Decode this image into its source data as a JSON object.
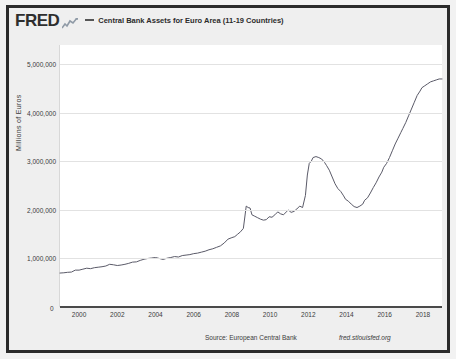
{
  "header": {
    "logo_text": "FRED",
    "logo_mark_name": "fred-line-chart-logo-icon",
    "series_label": "Central Bank Assets for Euro Area (11-19 Countries)"
  },
  "footer": {
    "source": "Source: European Central Bank",
    "url": "fred.stlouisfed.org"
  },
  "colors": {
    "line": "#5a5a68",
    "grid": "#e2e2e2",
    "axis": "#4a4a4a",
    "frame": "#2b2b2b",
    "page_background": "#f2f2f2",
    "plot_background": "#ffffff"
  },
  "chart_data": {
    "type": "line",
    "title": "Central Bank Assets for Euro Area (11-19 Countries)",
    "xlabel": "",
    "ylabel": "Millions of Euros",
    "ylim": [
      0,
      5400000
    ],
    "xlim": [
      1999.0,
      2019.0
    ],
    "grid": true,
    "legend_position": "top",
    "y_ticks": [
      1000000,
      2000000,
      3000000,
      4000000,
      5000000
    ],
    "y_tick_labels": [
      "1,000,000",
      "2,000,000",
      "3,000,000",
      "4,000,000",
      "5,000,000"
    ],
    "zero_label": "0",
    "x_ticks": [
      2000,
      2002,
      2004,
      2006,
      2008,
      2010,
      2012,
      2014,
      2016,
      2018
    ],
    "x_tick_labels": [
      "2000",
      "2002",
      "2004",
      "2006",
      "2008",
      "2010",
      "2012",
      "2014",
      "2016",
      "2018"
    ],
    "series": [
      {
        "name": "Central Bank Assets for Euro Area (11-19 Countries)",
        "color": "#5a5a68",
        "x": [
          1999.0,
          1999.2,
          1999.4,
          1999.6,
          1999.8,
          2000.0,
          2000.2,
          2000.4,
          2000.6,
          2000.8,
          2001.0,
          2001.2,
          2001.4,
          2001.6,
          2001.8,
          2002.0,
          2002.2,
          2002.4,
          2002.6,
          2002.8,
          2003.0,
          2003.2,
          2003.4,
          2003.6,
          2003.8,
          2004.0,
          2004.2,
          2004.4,
          2004.6,
          2004.8,
          2005.0,
          2005.2,
          2005.4,
          2005.6,
          2005.8,
          2006.0,
          2006.2,
          2006.4,
          2006.6,
          2006.8,
          2007.0,
          2007.2,
          2007.4,
          2007.6,
          2007.8,
          2008.0,
          2008.15,
          2008.3,
          2008.45,
          2008.6,
          2008.75,
          2008.85,
          2008.95,
          2009.05,
          2009.2,
          2009.35,
          2009.5,
          2009.65,
          2009.8,
          2009.95,
          2010.1,
          2010.25,
          2010.4,
          2010.55,
          2010.7,
          2010.85,
          2010.95,
          2011.1,
          2011.25,
          2011.4,
          2011.55,
          2011.7,
          2011.85,
          2011.95,
          2012.05,
          2012.15,
          2012.25,
          2012.4,
          2012.55,
          2012.7,
          2012.85,
          2012.95,
          2013.1,
          2013.25,
          2013.4,
          2013.55,
          2013.7,
          2013.85,
          2013.95,
          2014.1,
          2014.25,
          2014.4,
          2014.55,
          2014.7,
          2014.85,
          2014.95,
          2015.1,
          2015.25,
          2015.4,
          2015.55,
          2015.7,
          2015.85,
          2015.95,
          2016.1,
          2016.25,
          2016.4,
          2016.55,
          2016.7,
          2016.85,
          2016.95,
          2017.1,
          2017.25,
          2017.4,
          2017.55,
          2017.7,
          2017.85,
          2017.95,
          2018.1,
          2018.25,
          2018.4,
          2018.55,
          2018.7,
          2018.85,
          2018.95,
          2019.0
        ],
        "y": [
          700000,
          705000,
          715000,
          720000,
          760000,
          760000,
          780000,
          800000,
          790000,
          810000,
          820000,
          830000,
          845000,
          880000,
          870000,
          855000,
          865000,
          880000,
          900000,
          925000,
          930000,
          960000,
          985000,
          1000000,
          1010000,
          1020000,
          1000000,
          980000,
          1005000,
          1020000,
          1040000,
          1030000,
          1060000,
          1070000,
          1080000,
          1100000,
          1110000,
          1130000,
          1150000,
          1180000,
          1200000,
          1230000,
          1260000,
          1320000,
          1400000,
          1430000,
          1450000,
          1500000,
          1550000,
          1620000,
          2080000,
          2050000,
          2040000,
          1900000,
          1870000,
          1840000,
          1810000,
          1790000,
          1800000,
          1860000,
          1850000,
          1900000,
          1960000,
          1920000,
          1900000,
          1960000,
          2000000,
          1950000,
          1970000,
          2020000,
          2080000,
          2050000,
          2300000,
          2720000,
          2960000,
          3000000,
          3080000,
          3100000,
          3080000,
          3050000,
          2980000,
          2920000,
          2820000,
          2680000,
          2540000,
          2440000,
          2380000,
          2290000,
          2220000,
          2180000,
          2120000,
          2070000,
          2050000,
          2080000,
          2120000,
          2200000,
          2250000,
          2350000,
          2460000,
          2560000,
          2680000,
          2780000,
          2880000,
          2960000,
          3080000,
          3220000,
          3360000,
          3480000,
          3600000,
          3680000,
          3800000,
          3940000,
          4080000,
          4220000,
          4360000,
          4450000,
          4520000,
          4560000,
          4600000,
          4640000,
          4660000,
          4680000,
          4700000,
          4700000,
          4700000
        ]
      }
    ]
  }
}
